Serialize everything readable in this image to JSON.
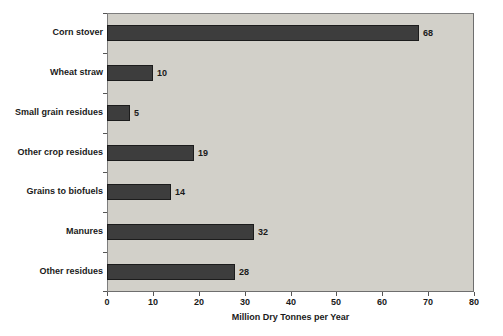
{
  "chart_data": {
    "type": "bar",
    "orientation": "horizontal",
    "categories": [
      "Corn stover",
      "Wheat straw",
      "Small grain residues",
      "Other crop residues",
      "Grains to biofuels",
      "Manures",
      "Other residues"
    ],
    "values": [
      68,
      10,
      5,
      19,
      14,
      32,
      28
    ],
    "title": "",
    "xlabel": "Million Dry Tonnes per Year",
    "ylabel": "",
    "xlim": [
      0,
      80
    ],
    "xticks": [
      0,
      10,
      20,
      30,
      40,
      50,
      60,
      70,
      80
    ],
    "grid": "off",
    "legend": "none",
    "data_labels": "end-of-bar",
    "colors": {
      "bar_fill": "#3d3d3d",
      "bar_border": "#1c1c1c",
      "plot_background": "#d2d0c9",
      "plot_border": "#7d7d7d",
      "page_background": "#ffffff",
      "text": "#1a1a1a"
    }
  }
}
